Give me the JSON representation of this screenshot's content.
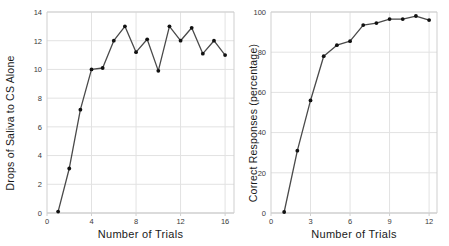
{
  "figure": {
    "background": "#ffffff",
    "line_color": "#4a4a4a",
    "marker_color": "#111111",
    "grid_color": "#e2e2e2",
    "axis_color": "#cfcfcf"
  },
  "chart_data": [
    {
      "id": "left",
      "type": "line",
      "title": "",
      "xlabel": "Number of Trials",
      "ylabel": "Drops of Saliva to CS Alone",
      "xlim": [
        0,
        16.8
      ],
      "ylim": [
        0,
        14
      ],
      "xticks": [
        0,
        4,
        8,
        12,
        16
      ],
      "xticklabels": [
        "0",
        "4",
        "8",
        "12",
        "16"
      ],
      "yticks": [
        0,
        2,
        4,
        6,
        8,
        10,
        12,
        14
      ],
      "yticklabels": [
        "0",
        "2",
        "4",
        "6",
        "8",
        "10",
        "12",
        "14"
      ],
      "grid": true,
      "legend": "none",
      "x": [
        1,
        2,
        3,
        4,
        5,
        6,
        7,
        8,
        9,
        10,
        11,
        12,
        13,
        14,
        15,
        16
      ],
      "values": [
        0.1,
        3.1,
        7.2,
        10.0,
        10.1,
        12.0,
        13.0,
        11.2,
        12.1,
        9.9,
        13.0,
        12.0,
        12.9,
        11.1,
        12.0,
        11.0
      ]
    },
    {
      "id": "right",
      "type": "line",
      "title": "",
      "xlabel": "Number of Trials",
      "ylabel": "Correct Responses (percentage)",
      "xlim": [
        0,
        12.6
      ],
      "ylim": [
        0,
        100
      ],
      "xticks": [
        0,
        3,
        6,
        9,
        12
      ],
      "xticklabels": [
        "0",
        "3",
        "6",
        "9",
        "12"
      ],
      "yticks": [
        0,
        20,
        40,
        60,
        80,
        100
      ],
      "yticklabels": [
        "0",
        "20",
        "40",
        "60",
        "80",
        "100"
      ],
      "grid": true,
      "legend": "none",
      "x": [
        1,
        2,
        3,
        4,
        5,
        6,
        7,
        8,
        9,
        10,
        11,
        12
      ],
      "values": [
        0.5,
        31.0,
        56.0,
        78.0,
        83.5,
        85.5,
        93.5,
        94.5,
        96.5,
        96.5,
        98.0,
        96.0
      ]
    }
  ]
}
